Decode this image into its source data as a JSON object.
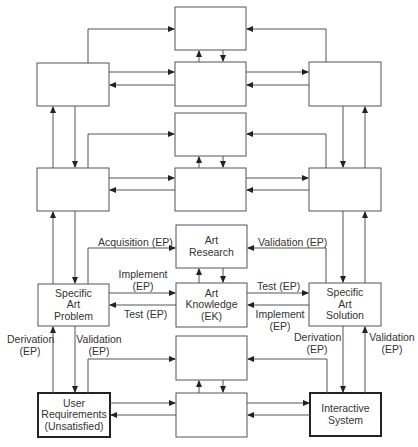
{
  "boxes": {
    "art_research": [
      "Art",
      "Research"
    ],
    "specific_art_problem": [
      "Specific",
      "Art",
      "Problem"
    ],
    "art_knowledge": [
      "Art",
      "Knowledge",
      "(EK)"
    ],
    "specific_art_solution": [
      "Specific",
      "Art",
      "Solution"
    ],
    "user_requirements": [
      "User",
      "Requirements",
      "(Unsatisfied)"
    ],
    "interactive_system": [
      "Interactive",
      "System"
    ]
  },
  "edges": {
    "acquisition": "Acquisition (EP)",
    "validation_top": "Validation (EP)",
    "implement_left": [
      "Implement",
      "(EP)"
    ],
    "test_left": "Test (EP)",
    "test_right": "Test (EP)",
    "implement_right": [
      "Implement",
      "(EP)"
    ],
    "derivation_left": [
      "Derivation",
      "(EP)"
    ],
    "validation_left": [
      "Validation",
      "(EP)"
    ],
    "derivation_right": [
      "Derivation",
      "(EP)"
    ],
    "validation_right": [
      "Validation",
      "(EP)"
    ]
  }
}
